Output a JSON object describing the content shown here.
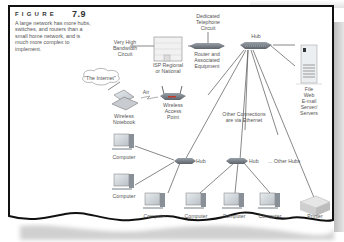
{
  "figure": {
    "label": "FIGURE",
    "number": "7.9",
    "caption": "A large network has more hubs, switches, and routers than a small home network, and is much more complex to implement."
  },
  "nodes": {
    "internet": "\"The Internet\"",
    "very_high_bandwidth": "Very High\nBandwidth\nCircuit",
    "isp": "ISP Regional\nor National",
    "dedicated_circuit": "Dedicated\nTelephone\nCircuit",
    "router": "Router and\nAssociated\nEquipment",
    "hub_main": "Hub",
    "servers": "File\nWeb\nE-mail\nServer/\nServers",
    "air": "Air",
    "wireless_notebook": "Wireless\nNotebook",
    "wireless_ap": "Wireless\nAccess\nPoint",
    "other_connections": "Other Connections\nare via Ethernet",
    "hub_left": "Hub",
    "hub_right": "Hub",
    "other_hubs": "... Other Hubs",
    "computer_label": "Computer",
    "printer": "Printer"
  },
  "computers": [
    {
      "id": "c1",
      "label": "Computer"
    },
    {
      "id": "c2",
      "label": "Computer"
    },
    {
      "id": "c3",
      "label": "Computer"
    },
    {
      "id": "c4",
      "label": "Computer"
    },
    {
      "id": "c5",
      "label": "Computer"
    },
    {
      "id": "c6",
      "label": "Computer"
    }
  ],
  "colors": {
    "border": "#111111",
    "line": "#555555",
    "device": "#7a7f86",
    "text": "#555555"
  }
}
